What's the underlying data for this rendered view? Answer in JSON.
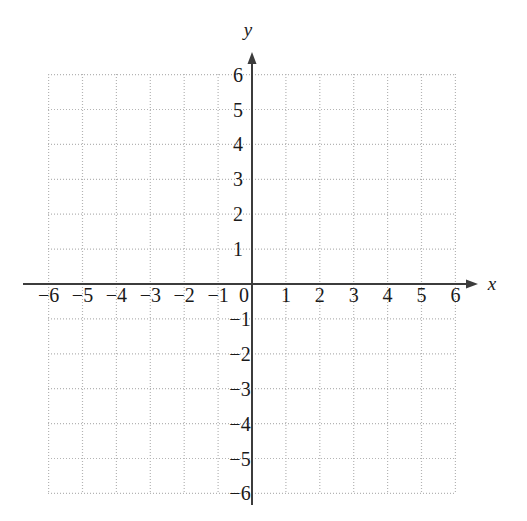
{
  "figure": {
    "kind": "cartesian-coordinate-plane",
    "title": "",
    "background_color": "#ffffff"
  },
  "chart_data": {
    "type": "scatter",
    "title": "",
    "subtitle": "",
    "xlabel": "x",
    "ylabel": "y",
    "xlim": [
      -6,
      6
    ],
    "ylim": [
      -6,
      6
    ],
    "xticks": [
      -6,
      -5,
      -4,
      -3,
      -2,
      -1,
      0,
      1,
      2,
      3,
      4,
      5,
      6
    ],
    "yticks": [
      6,
      5,
      4,
      3,
      2,
      1,
      -1,
      -2,
      -3,
      -4,
      -5,
      -6
    ],
    "xtick_labels": [
      "−6",
      "−5",
      "−4",
      "−3",
      "−2",
      "−1",
      "0",
      "1",
      "2",
      "3",
      "4",
      "5",
      "6"
    ],
    "ytick_labels": [
      "6",
      "5",
      "4",
      "3",
      "2",
      "1",
      "−1",
      "−2",
      "−3",
      "−4",
      "−5",
      "−6"
    ],
    "origin_label": "0",
    "grid": true,
    "grid_style": "dotted",
    "grid_step": 1,
    "legend": null,
    "series": [],
    "values": [],
    "annotations": [],
    "axis_arrows": {
      "x_positive": true,
      "y_positive": true
    }
  },
  "colors": {
    "axis": "#3c3c3c",
    "grid": "#b4b4b4",
    "text": "#1a1a1a",
    "background": "#ffffff"
  },
  "geometry": {
    "origin_x": 252,
    "origin_y": 284,
    "step_x": 33.9,
    "step_y": 34.9,
    "grid_left": 48,
    "grid_right": 455,
    "grid_top": 74,
    "grid_bottom": 493,
    "x_axis_start": 23,
    "x_axis_end": 478,
    "y_axis_top": 52,
    "y_axis_bottom": 505
  }
}
